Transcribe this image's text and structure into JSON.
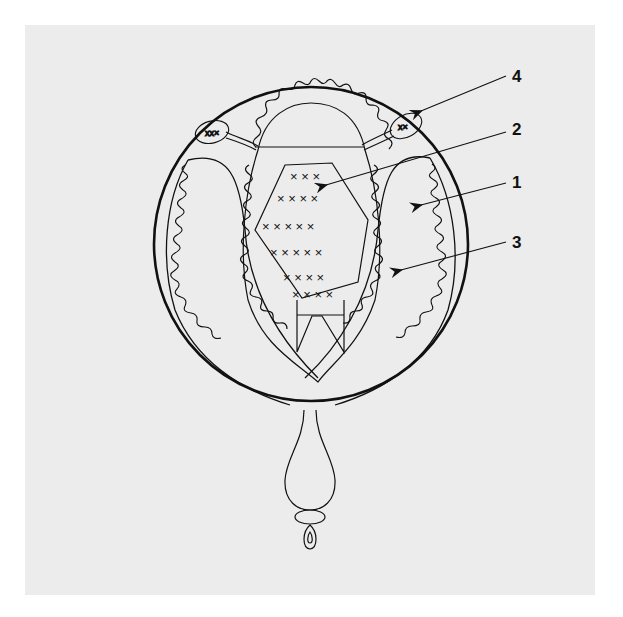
{
  "figure": {
    "background": "#ececec",
    "line_color": "#111111",
    "labels": [
      {
        "id": "1",
        "text": "1",
        "x": 512,
        "y": 173
      },
      {
        "id": "2",
        "text": "2",
        "x": 512,
        "y": 120
      },
      {
        "id": "3",
        "text": "3",
        "x": 512,
        "y": 233
      },
      {
        "id": "4",
        "text": "4",
        "x": 512,
        "y": 67
      }
    ]
  }
}
